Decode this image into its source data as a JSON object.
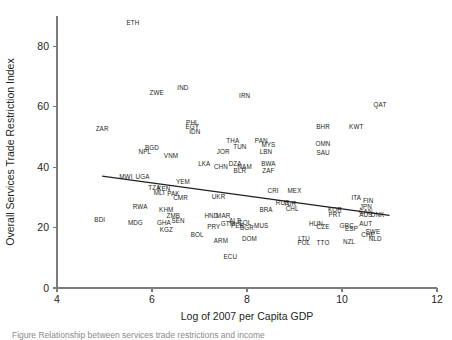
{
  "figure": {
    "caption_fragment": "Figure  Relationship between services trade restrictions and income"
  },
  "chart_data": {
    "type": "scatter",
    "title": "",
    "xlabel": "Log of 2007 per Capita GDP",
    "ylabel": "Overall Services Trade Restriction Index",
    "xlim": [
      4,
      12
    ],
    "ylim": [
      0,
      90
    ],
    "xticks": [
      4,
      6,
      8,
      10,
      12
    ],
    "yticks": [
      0,
      20,
      40,
      60,
      80
    ],
    "grid": false,
    "legend": null,
    "marker_style": "text-label-only",
    "trendline": {
      "type": "linear",
      "x": [
        4.95,
        11.0
      ],
      "y": [
        37.0,
        24.0
      ],
      "slope": -2.15,
      "intercept": 47.6
    },
    "points": [
      {
        "label": "ETH",
        "x": 5.6,
        "y": 87.0
      },
      {
        "label": "ZWE",
        "x": 6.1,
        "y": 64.0
      },
      {
        "label": "IND",
        "x": 6.65,
        "y": 65.5
      },
      {
        "label": "IRN",
        "x": 7.95,
        "y": 63.0
      },
      {
        "label": "QAT",
        "x": 10.8,
        "y": 60.0
      },
      {
        "label": "ZAR",
        "x": 4.95,
        "y": 52.0
      },
      {
        "label": "PHL",
        "x": 6.85,
        "y": 54.0
      },
      {
        "label": "EGY",
        "x": 6.85,
        "y": 52.5
      },
      {
        "label": "IDN",
        "x": 6.9,
        "y": 50.8
      },
      {
        "label": "BHR",
        "x": 9.6,
        "y": 52.5
      },
      {
        "label": "KWT",
        "x": 10.3,
        "y": 52.5
      },
      {
        "label": "THA",
        "x": 7.7,
        "y": 48.0
      },
      {
        "label": "PAN",
        "x": 8.3,
        "y": 48.0
      },
      {
        "label": "MYS",
        "x": 8.45,
        "y": 46.8
      },
      {
        "label": "OMN",
        "x": 9.6,
        "y": 47.0
      },
      {
        "label": "TUN",
        "x": 7.85,
        "y": 46.0
      },
      {
        "label": "BGD",
        "x": 6.0,
        "y": 45.5
      },
      {
        "label": "NPL",
        "x": 5.85,
        "y": 44.5
      },
      {
        "label": "JOR",
        "x": 7.5,
        "y": 44.5
      },
      {
        "label": "LBN",
        "x": 8.4,
        "y": 44.5
      },
      {
        "label": "SAU",
        "x": 9.6,
        "y": 44.0
      },
      {
        "label": "VNM",
        "x": 6.4,
        "y": 43.0
      },
      {
        "label": "LKA",
        "x": 7.1,
        "y": 40.5
      },
      {
        "label": "DZA",
        "x": 7.75,
        "y": 40.5
      },
      {
        "label": "BWA",
        "x": 8.45,
        "y": 40.5
      },
      {
        "label": "CHN",
        "x": 7.45,
        "y": 39.5
      },
      {
        "label": "NAM",
        "x": 7.95,
        "y": 39.3
      },
      {
        "label": "BLR",
        "x": 7.85,
        "y": 38.0
      },
      {
        "label": "ZAF",
        "x": 8.45,
        "y": 38.0
      },
      {
        "label": "MWI",
        "x": 5.45,
        "y": 36.0
      },
      {
        "label": "UGA",
        "x": 5.8,
        "y": 36.0
      },
      {
        "label": "YEM",
        "x": 6.65,
        "y": 34.5
      },
      {
        "label": "TZA",
        "x": 6.05,
        "y": 32.5
      },
      {
        "label": "KEN",
        "x": 6.25,
        "y": 32.0
      },
      {
        "label": "CRI",
        "x": 8.55,
        "y": 31.5
      },
      {
        "label": "MEX",
        "x": 9.0,
        "y": 31.5
      },
      {
        "label": "MLI",
        "x": 6.15,
        "y": 30.8
      },
      {
        "label": "PAK",
        "x": 6.45,
        "y": 30.5
      },
      {
        "label": "UKR",
        "x": 7.4,
        "y": 29.5
      },
      {
        "label": "CMR",
        "x": 6.6,
        "y": 29.0
      },
      {
        "label": "ITA",
        "x": 10.3,
        "y": 29.0
      },
      {
        "label": "FIN",
        "x": 10.55,
        "y": 28.0
      },
      {
        "label": "RUS",
        "x": 8.75,
        "y": 27.5
      },
      {
        "label": "TUR",
        "x": 8.9,
        "y": 27.0
      },
      {
        "label": "RWA",
        "x": 5.75,
        "y": 26.0
      },
      {
        "label": "JPN",
        "x": 10.5,
        "y": 26.0
      },
      {
        "label": "CHL",
        "x": 8.95,
        "y": 25.5
      },
      {
        "label": "BRA",
        "x": 8.4,
        "y": 25.0
      },
      {
        "label": "KHM",
        "x": 6.3,
        "y": 25.0
      },
      {
        "label": "KOR",
        "x": 9.85,
        "y": 25.0
      },
      {
        "label": "CAN",
        "x": 10.5,
        "y": 24.5
      },
      {
        "label": "AUS",
        "x": 10.5,
        "y": 23.5
      },
      {
        "label": "DNK",
        "x": 10.75,
        "y": 23.5
      },
      {
        "label": "PRT",
        "x": 9.85,
        "y": 23.5
      },
      {
        "label": "ZMB",
        "x": 6.45,
        "y": 23.0
      },
      {
        "label": "HND",
        "x": 7.25,
        "y": 23.0
      },
      {
        "label": "MAR",
        "x": 7.5,
        "y": 23.0
      },
      {
        "label": "BDI",
        "x": 4.9,
        "y": 22.0
      },
      {
        "label": "SEN",
        "x": 6.55,
        "y": 21.5
      },
      {
        "label": "ALB",
        "x": 7.75,
        "y": 21.5
      },
      {
        "label": "COL",
        "x": 7.95,
        "y": 21.0
      },
      {
        "label": "MDG",
        "x": 5.65,
        "y": 21.0
      },
      {
        "label": "GHA",
        "x": 6.25,
        "y": 20.8
      },
      {
        "label": "GTM",
        "x": 7.6,
        "y": 20.5
      },
      {
        "label": "AUT",
        "x": 10.5,
        "y": 20.5
      },
      {
        "label": "HUN",
        "x": 9.45,
        "y": 20.5
      },
      {
        "label": "MUS",
        "x": 8.3,
        "y": 20.0
      },
      {
        "label": "PER",
        "x": 7.8,
        "y": 19.8
      },
      {
        "label": "GRC",
        "x": 10.1,
        "y": 20.0
      },
      {
        "label": "CZE",
        "x": 9.6,
        "y": 19.5
      },
      {
        "label": "BGR",
        "x": 8.0,
        "y": 19.3
      },
      {
        "label": "PRY",
        "x": 7.3,
        "y": 19.5
      },
      {
        "label": "ESP",
        "x": 10.2,
        "y": 19.0
      },
      {
        "label": "KGZ",
        "x": 6.3,
        "y": 18.5
      },
      {
        "label": "SWE",
        "x": 10.65,
        "y": 18.0
      },
      {
        "label": "CHE",
        "x": 10.55,
        "y": 17.0
      },
      {
        "label": "BOL",
        "x": 6.95,
        "y": 17.0
      },
      {
        "label": "DOM",
        "x": 8.05,
        "y": 15.5
      },
      {
        "label": "LTU",
        "x": 9.2,
        "y": 15.5
      },
      {
        "label": "ARM",
        "x": 7.45,
        "y": 15.0
      },
      {
        "label": "NLD",
        "x": 10.7,
        "y": 15.5
      },
      {
        "label": "NZL",
        "x": 10.15,
        "y": 14.5
      },
      {
        "label": "POL",
        "x": 9.2,
        "y": 14.3
      },
      {
        "label": "TTO",
        "x": 9.6,
        "y": 14.3
      },
      {
        "label": "ECU",
        "x": 7.65,
        "y": 9.5
      }
    ]
  }
}
